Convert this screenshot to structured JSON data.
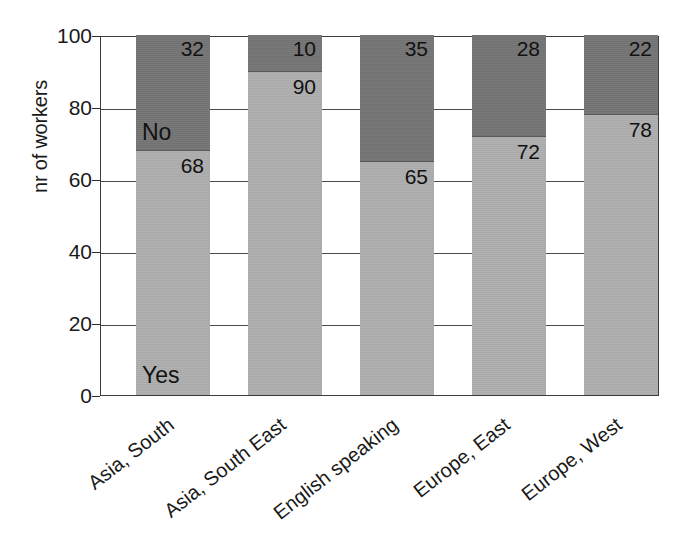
{
  "chart_data": {
    "type": "bar",
    "subtype": "stacked-bar-percent",
    "title": "",
    "xlabel": "",
    "ylabel": "nr of workers",
    "ylim": [
      0,
      100
    ],
    "yticks": [
      0,
      20,
      40,
      60,
      80,
      100
    ],
    "grid": true,
    "legend": "in-bar-labels",
    "categories": [
      "Asia, South",
      "Asia, South East",
      "English speaking",
      "Europe, East",
      "Europe, West"
    ],
    "series": [
      {
        "name": "Yes",
        "color": "#aeaeae",
        "values": [
          68,
          90,
          65,
          72,
          78
        ]
      },
      {
        "name": "No",
        "color": "#767676",
        "values": [
          32,
          10,
          35,
          28,
          22
        ]
      }
    ],
    "annotations": {
      "yes_label": "Yes",
      "no_label": "No",
      "yes_label_bar_index": 0,
      "no_label_bar_index": 0
    }
  },
  "axis": {
    "y_tick_labels": [
      "100",
      "80",
      "60",
      "40",
      "20",
      "0"
    ],
    "y_title": "nr of workers"
  },
  "bars": [
    {
      "category": "Asia, South",
      "yes_value": 68,
      "no_value": 32,
      "yes_label": "68",
      "no_label": "32"
    },
    {
      "category": "Asia, South East",
      "yes_value": 90,
      "no_value": 10,
      "yes_label": "90",
      "no_label": "10"
    },
    {
      "category": "English speaking",
      "yes_value": 65,
      "no_value": 35,
      "yes_label": "65",
      "no_label": "35"
    },
    {
      "category": "Europe, East",
      "yes_value": 72,
      "no_value": 28,
      "yes_label": "72",
      "no_label": "28"
    },
    {
      "category": "Europe, West",
      "yes_value": 78,
      "no_value": 22,
      "yes_label": "22",
      "no_label": "22"
    }
  ],
  "bar_labels": {
    "b0_no": "32",
    "b0_yes": "68",
    "b1_no": "10",
    "b1_yes": "90",
    "b2_no": "35",
    "b2_yes": "65",
    "b3_no": "28",
    "b3_yes": "72",
    "b4_no": "22",
    "b4_yes": "78"
  },
  "x_categories": {
    "c0": "Asia, South",
    "c1": "Asia, South East",
    "c2": "English speaking",
    "c3": "Europe, East",
    "c4": "Europe, West"
  },
  "y_labels": {
    "t100": "100",
    "t80": "80",
    "t60": "60",
    "t40": "40",
    "t20": "20",
    "t0": "0"
  },
  "series_labels": {
    "yes": "Yes",
    "no": "No"
  },
  "colors": {
    "yes_fill": "#aeaeae",
    "no_fill": "#767676",
    "axis": "#3b3b3b",
    "grid": "#4a4a4a",
    "text": "#1a1a1a",
    "background": "#ffffff"
  }
}
